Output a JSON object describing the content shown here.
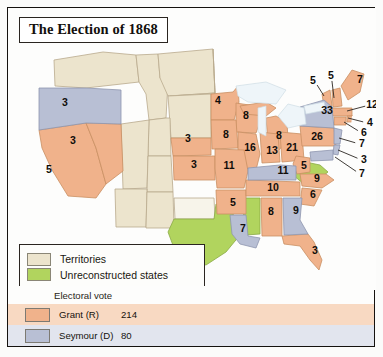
{
  "title": "The Election of 1868",
  "legend": {
    "items": [
      {
        "label": "Territories",
        "color": "#ece4cd"
      },
      {
        "label": "Unreconstructed states",
        "color": "#b1d45e"
      }
    ]
  },
  "electoral": {
    "heading": "Electoral vote",
    "rows": [
      {
        "name": "Grant (R)",
        "votes": "214",
        "color": "#f0b28b"
      },
      {
        "name": "Seymour (D)",
        "votes": "80",
        "color": "#b8bfd4"
      }
    ]
  },
  "colors": {
    "grant": "#f0b28b",
    "seymour": "#b8bfd4",
    "territory": "#ece4cd",
    "unreconstructed": "#b1d45e",
    "water": "#e8f1f6",
    "border": "#9a7f63"
  },
  "chart_data": {
    "type": "map",
    "title": "The Election of 1868",
    "legend_position": "bottom-left",
    "categories": [
      "Grant (R)",
      "Seymour (D)",
      "Unreconstructed states",
      "Territories"
    ],
    "values": [
      214,
      80,
      0,
      0
    ],
    "states": [
      {
        "name": "Oregon",
        "votes": "3",
        "party": "seymour",
        "x": 57,
        "y": 95
      },
      {
        "name": "Nevada",
        "votes": "3",
        "party": "grant",
        "x": 65,
        "y": 133
      },
      {
        "name": "California",
        "votes": "5",
        "party": "grant",
        "x": 41,
        "y": 162
      },
      {
        "name": "Minnesota",
        "votes": "4",
        "party": "grant",
        "x": 210,
        "y": 93
      },
      {
        "name": "Wisconsin",
        "votes": "8",
        "party": "grant",
        "x": 238,
        "y": 108
      },
      {
        "name": "Michigan",
        "votes": "8",
        "party": "grant",
        "x": 271,
        "y": 128
      },
      {
        "name": "Nebraska",
        "votes": "3",
        "party": "grant",
        "x": 180,
        "y": 131
      },
      {
        "name": "Iowa",
        "votes": "8",
        "party": "grant",
        "x": 218,
        "y": 127
      },
      {
        "name": "Kansas",
        "votes": "3",
        "party": "grant",
        "x": 186,
        "y": 157
      },
      {
        "name": "Illinois",
        "votes": "16",
        "party": "grant",
        "x": 242,
        "y": 140
      },
      {
        "name": "Indiana",
        "votes": "13",
        "party": "grant",
        "x": 264,
        "y": 143
      },
      {
        "name": "Ohio",
        "votes": "21",
        "party": "grant",
        "x": 284,
        "y": 140
      },
      {
        "name": "Missouri",
        "votes": "11",
        "party": "grant",
        "x": 221,
        "y": 158
      },
      {
        "name": "Arkansas",
        "votes": "5",
        "party": "grant",
        "x": 225,
        "y": 195
      },
      {
        "name": "Louisiana",
        "votes": "7",
        "party": "seymour",
        "x": 235,
        "y": 221
      },
      {
        "name": "Kentucky",
        "votes": "11",
        "party": "seymour",
        "x": 275,
        "y": 163
      },
      {
        "name": "Tennessee",
        "votes": "10",
        "party": "grant",
        "x": 265,
        "y": 180
      },
      {
        "name": "Alabama",
        "votes": "8",
        "party": "grant",
        "x": 263,
        "y": 204
      },
      {
        "name": "Georgia",
        "votes": "9",
        "party": "seymour",
        "x": 288,
        "y": 203
      },
      {
        "name": "Florida",
        "votes": "3",
        "party": "grant",
        "x": 307,
        "y": 243
      },
      {
        "name": "South Carolina",
        "votes": "6",
        "party": "grant",
        "x": 305,
        "y": 187
      },
      {
        "name": "North Carolina",
        "votes": "9",
        "party": "grant",
        "x": 309,
        "y": 171
      },
      {
        "name": "West Virginia",
        "votes": "5",
        "party": "grant",
        "x": 296,
        "y": 158
      },
      {
        "name": "Pennsylvania",
        "votes": "26",
        "party": "grant",
        "x": 309,
        "y": 129
      },
      {
        "name": "New York",
        "votes": "33",
        "party": "seymour",
        "x": 319,
        "y": 103
      }
    ],
    "callouts": [
      {
        "name": "Vermont",
        "votes": "5",
        "party": "grant",
        "lx": 305,
        "ly": 73,
        "ex": 316,
        "ey": 88
      },
      {
        "name": "New Hampshire",
        "votes": "5",
        "party": "grant",
        "lx": 323,
        "ly": 68,
        "ex": 326,
        "ey": 90
      },
      {
        "name": "Maine",
        "votes": "7",
        "party": "grant",
        "lx": 352,
        "ly": 72,
        "ex": 352,
        "ey": 72
      },
      {
        "name": "Massachusetts",
        "votes": "12",
        "party": "grant",
        "lx": 364,
        "ly": 97,
        "ex": 339,
        "ey": 103
      },
      {
        "name": "Rhode Island",
        "votes": "4",
        "party": "grant",
        "lx": 362,
        "ly": 115,
        "ex": 340,
        "ey": 110
      },
      {
        "name": "Connecticut",
        "votes": "6",
        "party": "grant",
        "lx": 356,
        "ly": 125,
        "ex": 336,
        "ey": 114
      },
      {
        "name": "New Jersey",
        "votes": "7",
        "party": "seymour",
        "lx": 354,
        "ly": 136,
        "ex": 331,
        "ey": 130
      },
      {
        "name": "Delaware",
        "votes": "3",
        "party": "seymour",
        "lx": 356,
        "ly": 152,
        "ex": 330,
        "ey": 142
      },
      {
        "name": "Maryland",
        "votes": "7",
        "party": "seymour",
        "lx": 354,
        "ly": 166,
        "ex": 327,
        "ey": 149
      }
    ],
    "unreconstructed": [
      "Texas",
      "Mississippi",
      "Virginia"
    ],
    "territories": [
      "Washington Territory",
      "Idaho Territory",
      "Montana Territory",
      "Dakota Territory",
      "Wyoming Territory",
      "Utah Territory",
      "Colorado Territory",
      "Arizona Territory",
      "New Mexico Territory",
      "Indian Territory"
    ]
  }
}
